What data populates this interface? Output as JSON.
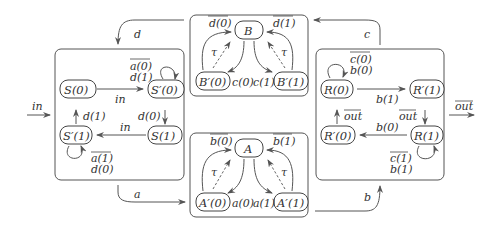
{
  "diagram": {
    "type": "process-network",
    "colors": {
      "stroke": "#555555",
      "text": "#333333",
      "background": "#ffffff"
    },
    "external": {
      "input": {
        "label": "in"
      },
      "output": {
        "label": "out",
        "overlined": true
      }
    },
    "channels": {
      "a": "a",
      "b": "b",
      "c": "c",
      "d": "d"
    },
    "sender": {
      "states": {
        "s0": "S(0)",
        "sp0": "S′(0)",
        "s1": "S(1)",
        "sp1": "S′(1)"
      },
      "edges": {
        "s0_to_sp0": "in",
        "sp0_loop_1": "a(0)",
        "sp0_loop_2": "d(1)",
        "sp0_to_s1": "d(0)",
        "s1_to_sp1": "in",
        "sp1_loop_1": "a(1)",
        "sp1_loop_2": "d(0)",
        "sp1_to_s0": "d(1)"
      }
    },
    "channel_b": {
      "states": {
        "center": "B",
        "left": "B′(0)",
        "right": "B′(1)"
      },
      "edges": {
        "left_to_center": "d(0)",
        "right_to_center": "d(1)",
        "center_to_left": "c(0)",
        "center_to_right": "c(1)",
        "tau_left": "τ",
        "tau_right": "τ"
      }
    },
    "channel_a": {
      "states": {
        "center": "A",
        "left": "A′(0)",
        "right": "A′(1)"
      },
      "edges": {
        "left_to_center": "b(0)",
        "right_to_center": "b(1)",
        "center_to_left": "a(0)",
        "center_to_right": "a(1)",
        "tau_left": "τ",
        "tau_right": "τ"
      }
    },
    "receiver": {
      "states": {
        "r0": "R(0)",
        "rp1": "R′(1)",
        "r1": "R(1)",
        "rp0": "R′(0)"
      },
      "edges": {
        "r0_loop_1": "c(0)",
        "r0_loop_2": "b(0)",
        "r0_to_rp1": "b(1)",
        "rp1_to_r1": "out",
        "r1_to_rp0": "b(0)",
        "r1_loop_1": "c(1)",
        "r1_loop_2": "b(1)",
        "rp0_to_r0": "out"
      }
    }
  }
}
